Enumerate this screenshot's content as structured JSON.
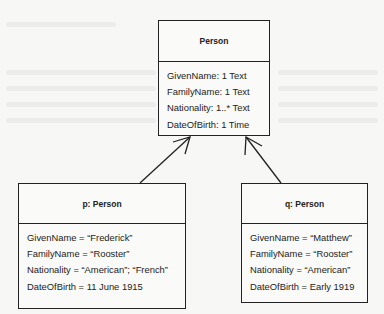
{
  "diagram": {
    "type": "uml-class-and-object",
    "class_box": {
      "title": "Person",
      "attributes": [
        "GivenName: 1 Text",
        "FamilyName: 1 Text",
        "Nationality: 1..* Text",
        "DateOfBirth: 1 Time"
      ]
    },
    "instances": [
      {
        "title": "p: Person",
        "attributes": [
          "GivenName = “Frederick”",
          "FamilyName =  “Rooster”",
          "Nationality = “American”; “French”",
          "DateOfBirth = 11 June 1915"
        ]
      },
      {
        "title": "q: Person",
        "attributes": [
          "GivenName = “Matthew”",
          "FamilyName = “Rooster”",
          "Nationality = “American”",
          "DateOfBirth = Early 1919"
        ]
      }
    ],
    "edges": [
      {
        "from": "p: Person",
        "to": "Person",
        "style": "open-arrow"
      },
      {
        "from": "q: Person",
        "to": "Person",
        "style": "open-arrow"
      }
    ]
  }
}
